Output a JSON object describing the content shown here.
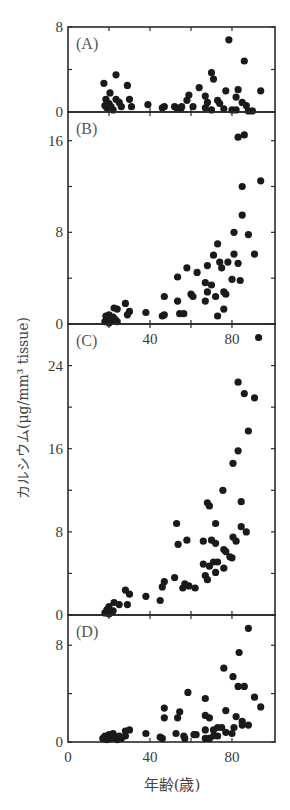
{
  "chart_data": {
    "type": "scatter",
    "title": "",
    "xlabel": "年齢(歳)",
    "ylabel": "カルシウム(μg/mm³ tissue)",
    "xlim": [
      0,
      101
    ],
    "xticks": [
      0,
      40,
      80
    ],
    "xtick_labels": [
      "0",
      "40",
      "80"
    ],
    "grid": false,
    "legend": null,
    "marker_color": "#1a1a1a",
    "panels": [
      {
        "label": "(A)",
        "ylim": [
          0,
          8
        ],
        "yticks": [
          0,
          8
        ],
        "ytick_labels": [
          "0",
          "8"
        ],
        "minor_yticks": [
          4
        ],
        "box": [
          68,
          27,
          275,
          112
        ],
        "points": [
          [
            17.5,
            2.7
          ],
          [
            23.4,
            3.5
          ],
          [
            29,
            2.5
          ],
          [
            20.5,
            1.8
          ],
          [
            18.5,
            1.2
          ],
          [
            20,
            0.8
          ],
          [
            23.4,
            1.2
          ],
          [
            25,
            0.9
          ],
          [
            30,
            1.2
          ],
          [
            21,
            0.5
          ],
          [
            26,
            0.5
          ],
          [
            31,
            0.5
          ],
          [
            19,
            0.4
          ],
          [
            22,
            0.2
          ],
          [
            18,
            0.6
          ],
          [
            39,
            0.7
          ],
          [
            47,
            0.5
          ],
          [
            46,
            0.4
          ],
          [
            52,
            0.5
          ],
          [
            53,
            0.4
          ],
          [
            55,
            0.3
          ],
          [
            55.5,
            0.5
          ],
          [
            58,
            1.1
          ],
          [
            59,
            1.6
          ],
          [
            61,
            0.5
          ],
          [
            64,
            2.3
          ],
          [
            67,
            1.5
          ],
          [
            68,
            0.9
          ],
          [
            67,
            0.4
          ],
          [
            70,
            0.2
          ],
          [
            70,
            3.7
          ],
          [
            71,
            3.1
          ],
          [
            73,
            1.1
          ],
          [
            74,
            0.8
          ],
          [
            76,
            0.3
          ],
          [
            77,
            2.0
          ],
          [
            78.5,
            6.8
          ],
          [
            80,
            0.2
          ],
          [
            82,
            1.4
          ],
          [
            83,
            2.1
          ],
          [
            82,
            0.2
          ],
          [
            85,
            0.9
          ],
          [
            86,
            4.8
          ],
          [
            87,
            0.6
          ],
          [
            88,
            0.1
          ],
          [
            90,
            0.1
          ],
          [
            94,
            2.0
          ]
        ]
      },
      {
        "label": "(B)",
        "ylim": [
          0,
          18.5
        ],
        "yticks": [
          0,
          8,
          16
        ],
        "ytick_labels": [
          "0",
          "8",
          "16"
        ],
        "minor_yticks": [
          4,
          12
        ],
        "box": [
          68,
          112,
          275,
          324
        ],
        "points": [
          [
            18,
            0.2
          ],
          [
            19,
            0.5
          ],
          [
            20,
            0.8
          ],
          [
            21,
            0.3
          ],
          [
            22,
            0.6
          ],
          [
            23,
            0.4
          ],
          [
            24,
            0.2
          ],
          [
            20,
            0.1
          ],
          [
            18.5,
            0.7
          ],
          [
            22.5,
            1.4
          ],
          [
            24,
            1.3
          ],
          [
            28,
            1.8
          ],
          [
            30,
            1.1
          ],
          [
            29,
            0.8
          ],
          [
            38,
            1.0
          ],
          [
            46,
            0.7
          ],
          [
            47,
            0.8
          ],
          [
            47,
            2.4
          ],
          [
            53.5,
            4.1
          ],
          [
            53.5,
            2.0
          ],
          [
            54.5,
            0.9
          ],
          [
            56.5,
            0.9
          ],
          [
            58,
            4.9
          ],
          [
            60,
            2.6
          ],
          [
            61,
            2.4
          ],
          [
            63,
            4.5
          ],
          [
            67,
            3.6
          ],
          [
            67,
            2.0
          ],
          [
            68,
            5.1
          ],
          [
            68,
            2.8
          ],
          [
            70,
            3.4
          ],
          [
            71,
            6.0
          ],
          [
            72,
            2.4
          ],
          [
            73,
            7.0
          ],
          [
            73,
            0.7
          ],
          [
            74,
            5.4
          ],
          [
            75,
            4.9
          ],
          [
            76,
            2.8
          ],
          [
            76,
            1.3
          ],
          [
            77,
            2.6
          ],
          [
            78,
            5.4
          ],
          [
            80,
            3.9
          ],
          [
            81,
            8.0
          ],
          [
            81,
            6.1
          ],
          [
            83,
            5.3
          ],
          [
            84,
            3.8
          ],
          [
            83,
            16.3
          ],
          [
            86,
            16.5
          ],
          [
            85,
            12.0
          ],
          [
            85,
            9.5
          ],
          [
            88,
            7.8
          ],
          [
            91,
            6.1
          ],
          [
            94,
            12.5
          ]
        ]
      },
      {
        "label": "(C)",
        "ylim": [
          0,
          28
        ],
        "yticks": [
          0,
          8,
          16,
          24
        ],
        "ytick_labels": [
          "0",
          "8",
          "16",
          "24"
        ],
        "minor_yticks": [
          4,
          12,
          20
        ],
        "box": [
          68,
          324,
          275,
          615
        ],
        "points": [
          [
            18,
            0.2
          ],
          [
            19,
            0.5
          ],
          [
            20,
            0.8
          ],
          [
            21,
            0.3
          ],
          [
            20,
            0.1
          ],
          [
            22,
            0.4
          ],
          [
            19.5,
            0.6
          ],
          [
            22.5,
            1.2
          ],
          [
            25,
            1.0
          ],
          [
            29,
            1.0
          ],
          [
            28,
            2.4
          ],
          [
            30,
            2.0
          ],
          [
            38,
            1.8
          ],
          [
            45,
            1.4
          ],
          [
            46,
            2.7
          ],
          [
            47,
            3.2
          ],
          [
            52,
            3.6
          ],
          [
            53,
            8.8
          ],
          [
            53.7,
            6.8
          ],
          [
            56,
            2.6
          ],
          [
            57,
            3.0
          ],
          [
            58,
            7.2
          ],
          [
            59,
            2.8
          ],
          [
            62,
            2.6
          ],
          [
            66,
            7.1
          ],
          [
            66,
            4.9
          ],
          [
            67,
            3.8
          ],
          [
            68,
            3.4
          ],
          [
            68,
            10.8
          ],
          [
            69,
            10.5
          ],
          [
            69,
            4.7
          ],
          [
            70,
            7.2
          ],
          [
            71,
            5.1
          ],
          [
            72,
            6.9
          ],
          [
            72,
            4.1
          ],
          [
            72,
            8.8
          ],
          [
            73,
            5.1
          ],
          [
            75.6,
            12.0
          ],
          [
            76,
            6.3
          ],
          [
            76,
            4.5
          ],
          [
            77,
            6.1
          ],
          [
            79,
            5.6
          ],
          [
            80,
            5.5
          ],
          [
            80.5,
            7.5
          ],
          [
            80.5,
            14.6
          ],
          [
            82,
            7.1
          ],
          [
            83,
            15.8
          ],
          [
            83,
            22.4
          ],
          [
            84.5,
            10.9
          ],
          [
            84.5,
            8.5
          ],
          [
            86,
            21.3
          ],
          [
            87,
            8.0
          ],
          [
            88,
            17.7
          ],
          [
            91,
            20.9
          ],
          [
            93,
            26.7
          ]
        ]
      },
      {
        "label": "(D)",
        "ylim": [
          0,
          10.5
        ],
        "yticks": [
          0,
          8
        ],
        "ytick_labels": [
          "0",
          "8"
        ],
        "minor_yticks": [
          4
        ],
        "box": [
          68,
          615,
          275,
          742
        ],
        "points": [
          [
            17,
            0.3
          ],
          [
            18,
            0.5
          ],
          [
            19,
            0.2
          ],
          [
            20,
            0.6
          ],
          [
            21,
            0.3
          ],
          [
            22,
            0.7
          ],
          [
            23,
            0.4
          ],
          [
            24,
            0.2
          ],
          [
            25,
            0.5
          ],
          [
            26,
            0.3
          ],
          [
            28,
            0.9
          ],
          [
            30,
            1.0
          ],
          [
            28,
            0.5
          ],
          [
            38,
            0.7
          ],
          [
            45,
            0.4
          ],
          [
            46,
            0.3
          ],
          [
            47,
            2.8
          ],
          [
            47,
            2.0
          ],
          [
            52.7,
            0.7
          ],
          [
            53.5,
            2.0
          ],
          [
            54.5,
            2.5
          ],
          [
            56.5,
            0.5
          ],
          [
            57,
            0.3
          ],
          [
            58.5,
            4.1
          ],
          [
            61.5,
            0.6
          ],
          [
            62.5,
            0.6
          ],
          [
            67,
            3.6
          ],
          [
            67,
            2.2
          ],
          [
            67,
            1.0
          ],
          [
            67,
            0.3
          ],
          [
            69,
            2.0
          ],
          [
            69,
            0.3
          ],
          [
            71,
            1.0
          ],
          [
            71,
            0.5
          ],
          [
            73,
            1.2
          ],
          [
            73,
            0.5
          ],
          [
            75,
            1.2
          ],
          [
            76,
            6.1
          ],
          [
            77,
            2.6
          ],
          [
            77,
            0.8
          ],
          [
            80,
            0.7
          ],
          [
            80.5,
            5.4
          ],
          [
            81,
            1.2
          ],
          [
            82,
            2.1
          ],
          [
            83,
            4.6
          ],
          [
            83.5,
            7.4
          ],
          [
            85,
            1.7
          ],
          [
            85,
            1.4
          ],
          [
            86,
            4.6
          ],
          [
            88,
            1.4
          ],
          [
            88,
            9.4
          ],
          [
            91,
            3.7
          ],
          [
            94,
            2.9
          ]
        ]
      }
    ]
  }
}
